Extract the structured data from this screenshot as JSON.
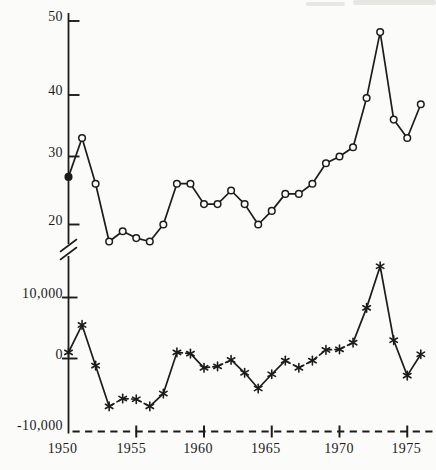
{
  "figure": {
    "background": "#fbfbf9",
    "ink": "#1c1c1c"
  },
  "chart_data": {
    "type": "line",
    "title": "",
    "x": [
      1950,
      1951,
      1952,
      1953,
      1954,
      1955,
      1956,
      1957,
      1958,
      1959,
      1960,
      1961,
      1962,
      1963,
      1964,
      1965,
      1966,
      1967,
      1968,
      1969,
      1970,
      1971,
      1972,
      1973,
      1974,
      1975,
      1976
    ],
    "x_axis": {
      "tick_labels": [
        "1950",
        "1955",
        "1960",
        "1965",
        "1970",
        "1975"
      ],
      "tick_years": [
        1950,
        1955,
        1960,
        1965,
        1970,
        1975
      ],
      "range": [
        1950,
        1976
      ],
      "baseline_style": "dashed",
      "baseline_at_lower_value": -10000
    },
    "upper_axis": {
      "tick_labels": [
        "20",
        "30",
        "40",
        "50"
      ],
      "tick_values": [
        20,
        30,
        40,
        50
      ],
      "range": [
        17,
        50
      ],
      "grid": false
    },
    "lower_axis": {
      "tick_labels": [
        "10,000",
        "0",
        "-10,000"
      ],
      "tick_values": [
        10000,
        0,
        -10000
      ],
      "range": [
        -10000,
        15000
      ],
      "grid": false
    },
    "axis_break_between_panels": true,
    "legend_position": "none",
    "series": [
      {
        "name": "upper-series",
        "marker": "open-circle",
        "first_point_filled": true,
        "line_style": "solid",
        "axis": "upper",
        "values": [
          27,
          33,
          26,
          17.5,
          19,
          18,
          17.5,
          20,
          26,
          26,
          23,
          23,
          25,
          23,
          20,
          22,
          24.5,
          24.5,
          26,
          29,
          30,
          31.5,
          39.5,
          48.5,
          36,
          33,
          38.5
        ]
      },
      {
        "name": "lower-series",
        "marker": "asterisk",
        "first_point_filled": false,
        "line_style": "dashed",
        "axis": "lower",
        "values": [
          1000,
          5500,
          -1000,
          -6700,
          -5600,
          -5700,
          -6700,
          -4900,
          1000,
          800,
          -1300,
          -1100,
          -200,
          -2000,
          -4200,
          -2200,
          -300,
          -1300,
          -300,
          1400,
          1500,
          2600,
          8300,
          15000,
          3000,
          -2400,
          700
        ]
      }
    ]
  }
}
